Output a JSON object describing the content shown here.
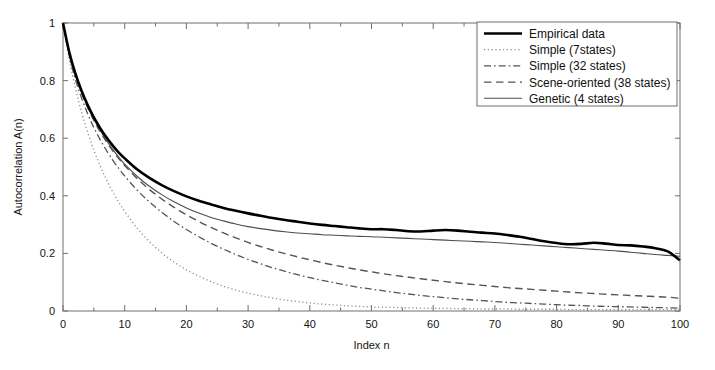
{
  "figure": {
    "background": "#ffffff",
    "axis_color": "#6e6e6e",
    "text_color": "#141414"
  },
  "chart_data": {
    "type": "line",
    "title": "",
    "xlabel": "Index n",
    "ylabel": "Autocorrelation A(n)",
    "xlim": [
      0,
      100
    ],
    "ylim": [
      0,
      1
    ],
    "xticks": [
      0,
      10,
      20,
      30,
      40,
      50,
      60,
      70,
      80,
      90,
      100
    ],
    "xtick_labels": [
      "0",
      "10",
      "20",
      "30",
      "40",
      "50",
      "60",
      "70",
      "80",
      "90",
      "100"
    ],
    "yticks": [
      0,
      0.2,
      0.4,
      0.6,
      0.8,
      1
    ],
    "ytick_labels": [
      "0",
      "0.2",
      "0.4",
      "0.6",
      "0.8",
      "1"
    ],
    "grid": false,
    "legend_position": "upper right",
    "x": [
      0,
      1,
      2,
      3,
      4,
      5,
      6,
      7,
      8,
      9,
      10,
      12,
      14,
      16,
      18,
      20,
      22,
      24,
      26,
      28,
      30,
      32,
      34,
      36,
      38,
      40,
      42,
      44,
      46,
      48,
      50,
      52,
      54,
      56,
      58,
      60,
      62,
      64,
      66,
      68,
      70,
      72,
      74,
      76,
      78,
      80,
      82,
      84,
      86,
      88,
      90,
      92,
      94,
      96,
      98,
      100
    ],
    "series": [
      {
        "name": "Empirical data",
        "style": "solid",
        "color": "#000000",
        "width": 2.6,
        "dash": "",
        "values": [
          1.0,
          0.9,
          0.825,
          0.765,
          0.715,
          0.672,
          0.636,
          0.604,
          0.576,
          0.551,
          0.53,
          0.492,
          0.462,
          0.437,
          0.416,
          0.398,
          0.383,
          0.37,
          0.358,
          0.348,
          0.339,
          0.331,
          0.323,
          0.316,
          0.31,
          0.304,
          0.299,
          0.295,
          0.291,
          0.287,
          0.284,
          0.284,
          0.281,
          0.277,
          0.276,
          0.279,
          0.281,
          0.279,
          0.275,
          0.272,
          0.269,
          0.264,
          0.258,
          0.25,
          0.242,
          0.236,
          0.232,
          0.233,
          0.237,
          0.234,
          0.229,
          0.228,
          0.224,
          0.218,
          0.207,
          0.176
        ]
      },
      {
        "name": "Simple (7states)",
        "style": "dotted",
        "color": "#8c8c8c",
        "width": 1.3,
        "dash": "1.2 2.6",
        "values": [
          1.0,
          0.875,
          0.775,
          0.69,
          0.62,
          0.558,
          0.505,
          0.458,
          0.416,
          0.379,
          0.346,
          0.288,
          0.241,
          0.202,
          0.17,
          0.143,
          0.121,
          0.102,
          0.086,
          0.073,
          0.062,
          0.053,
          0.045,
          0.038,
          0.033,
          0.028,
          0.024,
          0.021,
          0.018,
          0.016,
          0.014,
          0.013,
          0.012,
          0.011,
          0.01,
          0.009,
          0.009,
          0.008,
          0.008,
          0.007,
          0.007,
          0.007,
          0.006,
          0.006,
          0.006,
          0.006,
          0.005,
          0.005,
          0.005,
          0.005,
          0.005,
          0.005,
          0.005,
          0.005,
          0.005,
          0.005
        ]
      },
      {
        "name": "Simple (32 states)",
        "style": "dashdot",
        "color": "#555555",
        "width": 1.3,
        "dash": "7 3 1.6 3",
        "values": [
          1.0,
          0.888,
          0.805,
          0.74,
          0.685,
          0.637,
          0.596,
          0.559,
          0.526,
          0.496,
          0.469,
          0.42,
          0.379,
          0.343,
          0.311,
          0.283,
          0.258,
          0.235,
          0.215,
          0.196,
          0.179,
          0.164,
          0.15,
          0.138,
          0.126,
          0.116,
          0.106,
          0.098,
          0.09,
          0.082,
          0.076,
          0.07,
          0.064,
          0.059,
          0.054,
          0.05,
          0.046,
          0.042,
          0.039,
          0.036,
          0.033,
          0.03,
          0.028,
          0.026,
          0.024,
          0.022,
          0.02,
          0.019,
          0.017,
          0.016,
          0.015,
          0.014,
          0.013,
          0.012,
          0.011,
          0.01
        ]
      },
      {
        "name": "Scene-oriented (38 states)",
        "style": "dashed",
        "color": "#555555",
        "width": 1.4,
        "dash": "7.5 4.5",
        "values": [
          1.0,
          0.894,
          0.818,
          0.757,
          0.706,
          0.662,
          0.623,
          0.589,
          0.558,
          0.53,
          0.505,
          0.46,
          0.422,
          0.389,
          0.36,
          0.334,
          0.311,
          0.29,
          0.271,
          0.254,
          0.238,
          0.224,
          0.211,
          0.199,
          0.188,
          0.178,
          0.168,
          0.159,
          0.151,
          0.143,
          0.136,
          0.129,
          0.123,
          0.117,
          0.112,
          0.107,
          0.102,
          0.097,
          0.093,
          0.089,
          0.085,
          0.081,
          0.078,
          0.075,
          0.072,
          0.069,
          0.066,
          0.063,
          0.061,
          0.058,
          0.056,
          0.054,
          0.052,
          0.05,
          0.048,
          0.044
        ]
      },
      {
        "name": "Genetic (4 states)",
        "style": "solid",
        "color": "#4d4d4d",
        "width": 1.1,
        "dash": "",
        "values": [
          1.0,
          0.897,
          0.822,
          0.762,
          0.711,
          0.667,
          0.629,
          0.594,
          0.563,
          0.535,
          0.51,
          0.468,
          0.433,
          0.404,
          0.379,
          0.358,
          0.34,
          0.325,
          0.313,
          0.302,
          0.293,
          0.286,
          0.28,
          0.275,
          0.271,
          0.268,
          0.265,
          0.263,
          0.261,
          0.259,
          0.258,
          0.256,
          0.254,
          0.252,
          0.25,
          0.248,
          0.246,
          0.244,
          0.242,
          0.24,
          0.238,
          0.235,
          0.232,
          0.229,
          0.226,
          0.223,
          0.22,
          0.217,
          0.214,
          0.211,
          0.208,
          0.204,
          0.2,
          0.196,
          0.193,
          0.19
        ]
      }
    ]
  },
  "legend": {
    "entries": [
      {
        "label": "Empirical data"
      },
      {
        "label": "Simple (7states)"
      },
      {
        "label": "Simple (32 states)"
      },
      {
        "label": "Scene-oriented (38 states)"
      },
      {
        "label": "Genetic (4 states)"
      }
    ]
  }
}
